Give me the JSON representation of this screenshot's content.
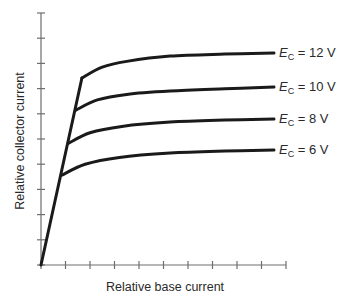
{
  "chart_data": {
    "type": "line",
    "title": "",
    "xlabel": "Relative base current",
    "ylabel": "Relative collector current",
    "xlim": [
      0,
      10
    ],
    "ylim": [
      0,
      10
    ],
    "x_ticks": 10,
    "y_ticks": 10,
    "tick_labels": "none",
    "grid": false,
    "legend": "inline labels at right end of each curve",
    "series": [
      {
        "name": "E_C = 12 V",
        "label_main": "E",
        "label_sub": "C",
        "label_rest": " = 12 V",
        "points": [
          [
            0,
            0
          ],
          [
            1.67,
            7.42
          ],
          [
            2.5,
            7.85
          ],
          [
            3.5,
            8.08
          ],
          [
            5.27,
            8.29
          ],
          [
            7.5,
            8.37
          ],
          [
            9.51,
            8.41
          ]
        ]
      },
      {
        "name": "E_C = 10 V",
        "label_main": "E",
        "label_sub": "C",
        "label_rest": " = 10 V",
        "points": [
          [
            1.43,
            6.15
          ],
          [
            2.3,
            6.55
          ],
          [
            3.5,
            6.77
          ],
          [
            5.27,
            6.9
          ],
          [
            7.5,
            6.99
          ],
          [
            9.51,
            7.06
          ]
        ]
      },
      {
        "name": "E_C = 8 V",
        "label_main": "E",
        "label_sub": "C",
        "label_rest": " = 8 V",
        "points": [
          [
            1.14,
            4.84
          ],
          [
            2.0,
            5.25
          ],
          [
            3.3,
            5.5
          ],
          [
            5.27,
            5.67
          ],
          [
            7.5,
            5.75
          ],
          [
            9.51,
            5.79
          ]
        ]
      },
      {
        "name": "E_C = 6 V",
        "label_main": "E",
        "label_sub": "C",
        "label_rest": " = 6 V",
        "points": [
          [
            0.86,
            3.57
          ],
          [
            1.8,
            4.0
          ],
          [
            3.2,
            4.27
          ],
          [
            5.27,
            4.44
          ],
          [
            7.5,
            4.52
          ],
          [
            9.51,
            4.56
          ]
        ]
      }
    ],
    "load_line": {
      "description": "steep linear rise from origin through all knee points",
      "points": [
        [
          0,
          0
        ],
        [
          0.86,
          3.57
        ],
        [
          1.14,
          4.84
        ],
        [
          1.43,
          6.15
        ],
        [
          1.67,
          7.42
        ]
      ]
    }
  }
}
